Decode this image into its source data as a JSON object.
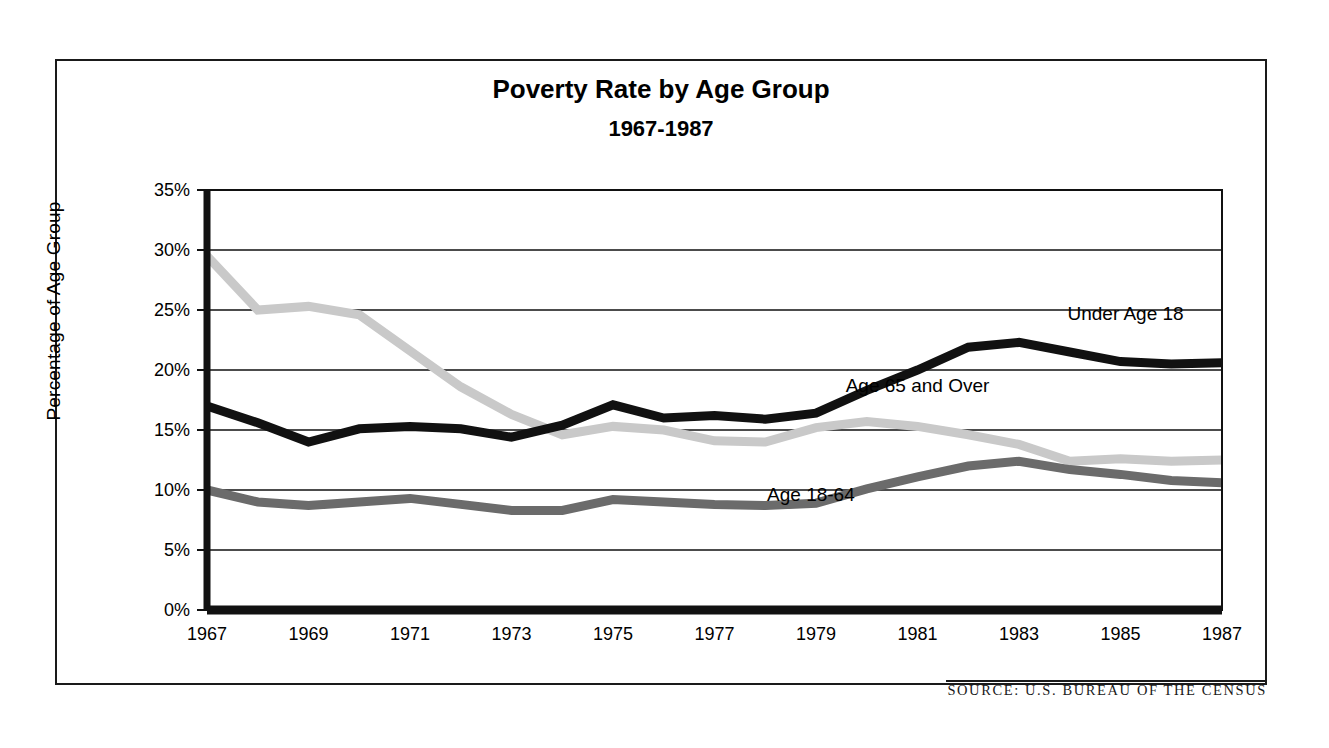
{
  "figure": {
    "source_note": "SOURCE: U.S. BUREAU OF THE CENSUS",
    "frame_color": "#1a1a1a",
    "background": "#ffffff"
  },
  "chart_data": {
    "type": "line",
    "title": "Poverty Rate by Age Group",
    "subtitle": "1967-1987",
    "xlabel": "",
    "ylabel": "Percentage of Age Group",
    "ylim": [
      0,
      35
    ],
    "xlim": [
      1967,
      1987
    ],
    "grid": true,
    "grid_axis": "y",
    "legend": "inline-annotations",
    "ytick_labels": [
      "0%",
      "5%",
      "10%",
      "15%",
      "20%",
      "25%",
      "30%",
      "35%"
    ],
    "ytick_values": [
      0,
      5,
      10,
      15,
      20,
      25,
      30,
      35
    ],
    "xtick_labels": [
      "1967",
      "1969",
      "1971",
      "1973",
      "1975",
      "1977",
      "1979",
      "1981",
      "1983",
      "1985",
      "1987"
    ],
    "xtick_values": [
      1967,
      1969,
      1971,
      1973,
      1975,
      1977,
      1979,
      1981,
      1983,
      1985,
      1987
    ],
    "x": [
      1967,
      1968,
      1969,
      1970,
      1971,
      1972,
      1973,
      1974,
      1975,
      1976,
      1977,
      1978,
      1979,
      1980,
      1981,
      1982,
      1983,
      1984,
      1985,
      1986,
      1987
    ],
    "series": [
      {
        "name": "Under Age 18",
        "color": "#111111",
        "label_x": 1985.1,
        "label_y": 24.2,
        "values": [
          17.0,
          15.6,
          14.0,
          15.1,
          15.3,
          15.1,
          14.4,
          15.4,
          17.1,
          16.0,
          16.2,
          15.9,
          16.4,
          18.3,
          20.0,
          21.9,
          22.3,
          21.5,
          20.7,
          20.5,
          20.6
        ]
      },
      {
        "name": "Age 65 and Over",
        "color": "#c9c9c9",
        "label_x": 1981.0,
        "label_y": 18.2,
        "values": [
          29.5,
          25.0,
          25.3,
          24.6,
          21.6,
          18.6,
          16.3,
          14.6,
          15.3,
          15.0,
          14.1,
          14.0,
          15.2,
          15.7,
          15.3,
          14.6,
          13.8,
          12.4,
          12.6,
          12.4,
          12.5
        ]
      },
      {
        "name": "Age 18-64",
        "color": "#6b6b6b",
        "label_x": 1978.9,
        "label_y": 9.1,
        "values": [
          10.0,
          9.0,
          8.7,
          9.0,
          9.3,
          8.8,
          8.3,
          8.3,
          9.2,
          9.0,
          8.8,
          8.7,
          8.9,
          10.1,
          11.1,
          12.0,
          12.4,
          11.7,
          11.3,
          10.8,
          10.6
        ]
      }
    ]
  }
}
